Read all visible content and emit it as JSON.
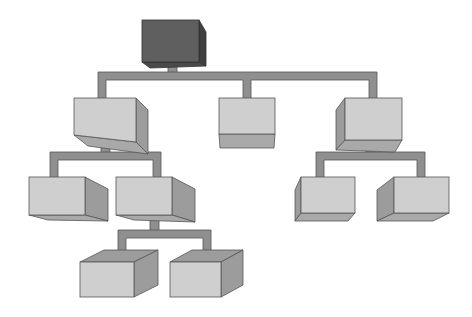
{
  "diagram": {
    "type": "hierarchy",
    "colors": {
      "root_front": "#5e5e5e",
      "root_side": "#3f3f3f",
      "root_top": "#4a4a4a",
      "node_front": "#cfcfcf",
      "node_side": "#9a9a9a",
      "node_bottom": "#a8a8a8",
      "connector": "#8f8f8f",
      "connector_dark": "#5a5a5a",
      "outline": "#555555"
    },
    "nodes": [
      {
        "id": "root",
        "level": 0
      },
      {
        "id": "l1-left",
        "level": 1,
        "parent": "root"
      },
      {
        "id": "l1-center",
        "level": 1,
        "parent": "root"
      },
      {
        "id": "l1-right",
        "level": 1,
        "parent": "root"
      },
      {
        "id": "l2-left-a",
        "level": 2,
        "parent": "l1-left"
      },
      {
        "id": "l2-left-b",
        "level": 2,
        "parent": "l1-left"
      },
      {
        "id": "l2-right-a",
        "level": 2,
        "parent": "l1-right"
      },
      {
        "id": "l2-right-b",
        "level": 2,
        "parent": "l1-right"
      },
      {
        "id": "l3-a",
        "level": 3,
        "parent": "l2-left-b"
      },
      {
        "id": "l3-b",
        "level": 3,
        "parent": "l2-left-b"
      }
    ]
  }
}
